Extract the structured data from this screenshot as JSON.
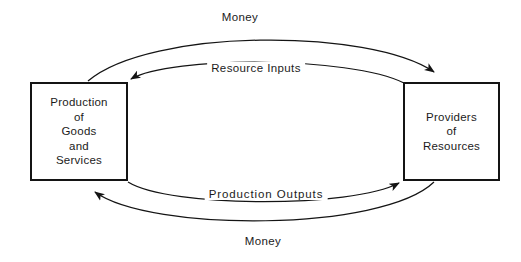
{
  "diagram": {
    "background_color": "#ffffff",
    "stroke_color": "#141414",
    "text_color": "#1b1b1b"
  },
  "nodes": {
    "production": {
      "name": "Production of Goods and Services",
      "lines": [
        "Production",
        "of",
        "Goods",
        "and",
        "Services"
      ]
    },
    "providers": {
      "name": "Providers of Resources",
      "lines": [
        "Providers",
        "of",
        "Resources"
      ]
    }
  },
  "edges": [
    {
      "id": "money-top",
      "label": "Money",
      "from": "production",
      "to": "providers",
      "direction": "left-to-right",
      "position": "outer-top"
    },
    {
      "id": "resource-inputs",
      "label": "Resource Inputs",
      "from": "providers",
      "to": "production",
      "direction": "right-to-left",
      "position": "inner-top"
    },
    {
      "id": "production-outputs",
      "label": "Production Outputs",
      "from": "production",
      "to": "providers",
      "direction": "left-to-right",
      "position": "inner-bottom"
    },
    {
      "id": "money-bottom",
      "label": "Money",
      "from": "providers",
      "to": "production",
      "direction": "right-to-left",
      "position": "outer-bottom"
    }
  ],
  "icons": {
    "arrowhead": "arrowhead-icon"
  }
}
